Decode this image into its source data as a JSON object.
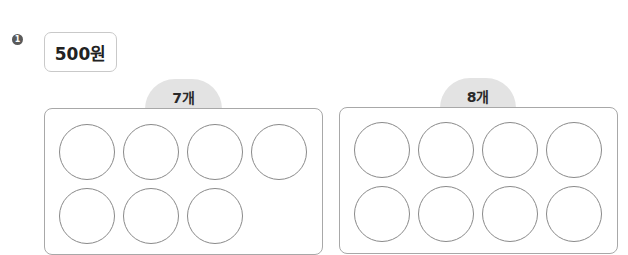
{
  "problem": {
    "number": "1",
    "price_label": "500원"
  },
  "groups": [
    {
      "tab_label": "7개",
      "count": 7,
      "columns": 4
    },
    {
      "tab_label": "8개",
      "count": 8,
      "columns": 4
    }
  ],
  "colors": {
    "tab_bg": "#e3e3e3",
    "panel_border": "#a8a8a8",
    "circle_border": "#8a8a8a",
    "bullet_bg": "#5a5a5a"
  }
}
